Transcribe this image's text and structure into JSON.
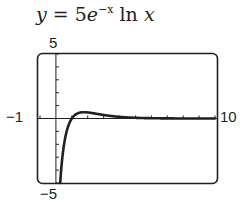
{
  "title": {
    "lhs": "y",
    "eq": " = 5",
    "base": "e",
    "exponent": "−x",
    "rest": " ln ",
    "var": "x"
  },
  "labels": {
    "ymax": "5",
    "ymin": "−5",
    "xmin": "−1",
    "xmax": "10"
  },
  "chart_data": {
    "type": "line",
    "xlabel": "",
    "ylabel": "",
    "xlim": [
      -1,
      10
    ],
    "ylim": [
      -5,
      5
    ],
    "grid": false,
    "x_ticks_interval": 1,
    "y_ticks_interval": 1,
    "series": [
      {
        "name": "y = 5e^(-x) ln x",
        "x": [
          0.27,
          0.3,
          0.4,
          0.5,
          0.7,
          1.0,
          1.5,
          1.76,
          2.0,
          3.0,
          4.0,
          5.0,
          6.0,
          7.0,
          8.0,
          9.0,
          10.0
        ],
        "y": [
          -5.0,
          -4.46,
          -3.07,
          -2.1,
          -0.89,
          0.0,
          0.45,
          0.48,
          0.47,
          0.27,
          0.13,
          0.05,
          0.02,
          0.01,
          0.0,
          0.0,
          0.0
        ]
      }
    ],
    "color": "#231f20"
  }
}
